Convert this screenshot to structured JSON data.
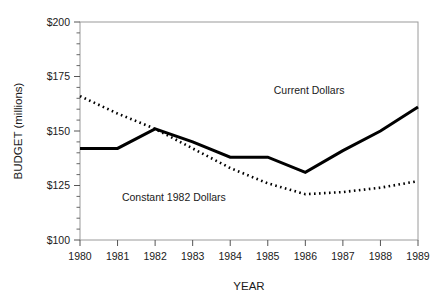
{
  "chart_data": {
    "type": "line",
    "title": "",
    "xlabel": "YEAR",
    "ylabel": "BUDGET (millions)",
    "x": [
      1980,
      1981,
      1982,
      1983,
      1984,
      1985,
      1986,
      1987,
      1988,
      1989
    ],
    "xtick_labels": [
      "1980",
      "1981",
      "1982",
      "1983",
      "1984",
      "1985",
      "1986",
      "1987",
      "1988",
      "1989"
    ],
    "ytick_labels": [
      "$100",
      "$125",
      "$150",
      "$175",
      "$200"
    ],
    "ytick_values": [
      100,
      125,
      150,
      175,
      200
    ],
    "ylim": [
      100,
      200
    ],
    "xlim": [
      1980,
      1989
    ],
    "grid": false,
    "minor_ticks_y": true,
    "legend": "inline-annotations",
    "series": [
      {
        "name": "Current Dollars",
        "style": "solid",
        "color": "#000000",
        "width": 3,
        "label_x": 1986.1,
        "label_y": 167,
        "values": [
          142,
          142,
          151,
          145,
          138,
          138,
          131,
          141,
          150,
          161
        ]
      },
      {
        "name": "Constant 1982 Dollars",
        "style": "dotted",
        "color": "#000000",
        "width": 2.6,
        "label_x": 1982.5,
        "label_y": 118,
        "values": [
          166,
          158,
          151,
          142,
          133,
          126,
          121,
          122,
          124,
          127
        ]
      }
    ]
  },
  "axes": {
    "y_axis_title": "BUDGET (millions)",
    "x_axis_title": "YEAR"
  },
  "colors": {
    "ink": "#000000",
    "frame": "#8c8c8c",
    "background": "#ffffff"
  }
}
